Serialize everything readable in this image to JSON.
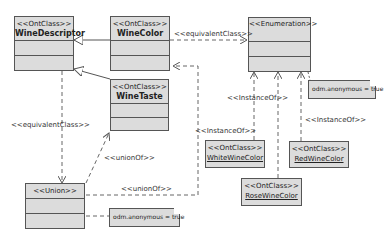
{
  "classes": {
    "wine_descriptor": {
      "stereotype": "<<OntClass>>",
      "name": "WineDescriptor"
    },
    "wine_color": {
      "stereotype": "<<OntClass>>",
      "name": "WineColor"
    },
    "wine_taste": {
      "stereotype": "<<OntClass>>",
      "name": "WineTaste"
    },
    "enumeration": {
      "stereotype": "<<Enumeration>>",
      "name": ""
    },
    "union": {
      "stereotype": "<<Union>>",
      "name": ""
    }
  },
  "instances": {
    "white": {
      "stereotype": "<<OntClass>>",
      "name": "WhiteWineColor"
    },
    "rose": {
      "stereotype": "<<OntClass>>",
      "name": "RoseWineColor"
    },
    "red": {
      "stereotype": "<<OntClass>>",
      "name": "RedWineColor"
    }
  },
  "notes": {
    "enum_note": "odm.anonymous = true",
    "union_note": "odm.anonymous = true"
  },
  "labels": {
    "equiv_top": "<<equivalentClass>>",
    "equiv_left": "<<equivalentClass>>",
    "union_of_upper": "<<unionOf>>",
    "union_of_lower": "<<unionOf>>",
    "instance_of_white": "<<InstanceOf>>",
    "instance_of_mid": "<<InstanceOf>>",
    "instance_of_red": "<<InstanceOf>>"
  },
  "colors": {
    "box_fill": "#dcdcdc",
    "border": "#555555",
    "line": "#666666"
  }
}
